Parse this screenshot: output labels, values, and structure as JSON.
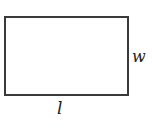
{
  "diagram": {
    "shape": "rectangle",
    "labels": {
      "width": "w",
      "length": "l"
    }
  }
}
